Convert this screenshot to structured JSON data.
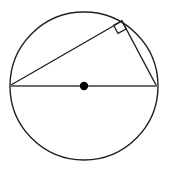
{
  "figure": {
    "canvas": {
      "width": 170,
      "height": 180,
      "background": "#ffffff"
    }
  },
  "colors": {
    "circle_stroke": "#231f20",
    "chord_stroke": "#231f20",
    "diameter_stroke": "#6e6e6e",
    "center_dot_fill": "#000000",
    "right_angle_stroke": "#231f20",
    "background": "#ffffff"
  },
  "strokes": {
    "circle_width": 1.4,
    "chord_width": 1.4,
    "diameter_width": 2.0,
    "right_angle_width": 1.3
  },
  "shapes": {
    "circle": {
      "name": "circle",
      "cx": 84,
      "cy": 86,
      "r": 74
    },
    "center_point": {
      "name": "center-point",
      "cx": 84,
      "cy": 86,
      "r": 4.2
    },
    "diameter": {
      "name": "diameter-segment",
      "x1": 10,
      "y1": 86,
      "x2": 158,
      "y2": 86
    },
    "chord_long": {
      "name": "hypotenuse-leg-left",
      "x1": 11,
      "y1": 85,
      "x2": 122,
      "y2": 21
    },
    "chord_short": {
      "name": "leg-right",
      "x1": 122,
      "y1": 21,
      "x2": 156,
      "y2": 85
    },
    "right_angle_marker": {
      "name": "right-angle-marker",
      "points": "113.6,25.2 118.0,33.4 126.2,29.0 121.8,20.8",
      "vertex_x": 122,
      "vertex_y": 21,
      "size": 9.3
    }
  },
  "vertices": [
    {
      "name": "vertex-left",
      "x": 11,
      "y": 85
    },
    {
      "name": "vertex-right",
      "x": 156,
      "y": 85
    },
    {
      "name": "vertex-apex",
      "x": 122,
      "y": 21
    }
  ]
}
